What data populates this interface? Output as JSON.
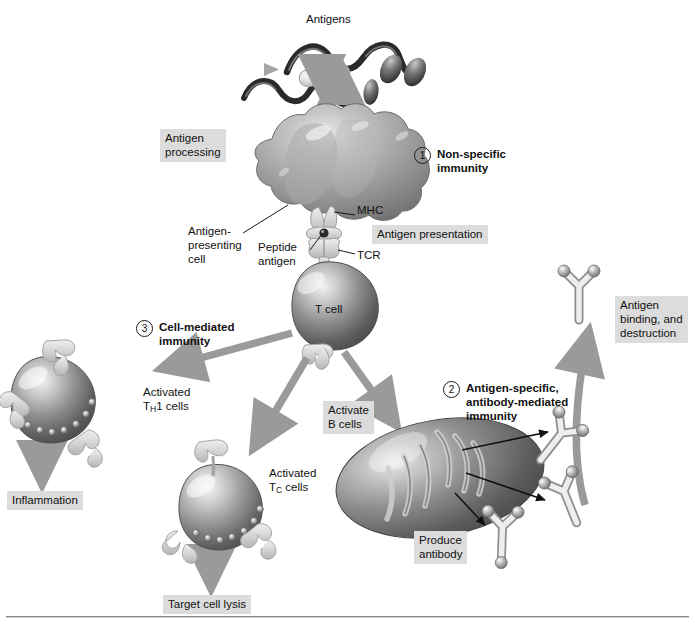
{
  "figure": {
    "background_color": "#ffffff",
    "label_box_color": "#dcdcdc",
    "arrow_color": "#9a9a9a",
    "leader_color": "#1a1a1a"
  },
  "labels": {
    "antigens": "Antigens",
    "antigen_processing": "Antigen\nprocessing",
    "antigen_presenting_cell": "Antigen-\npresenting\ncell",
    "peptide_antigen": "Peptide\nantigen",
    "mhc": "MHC",
    "tcr": "TCR",
    "antigen_presentation": "Antigen presentation",
    "t_cell": "T cell",
    "activated_th1_cells_line1": "Activated",
    "activated_th1_cells_line2_pre": "T",
    "activated_th1_cells_line2_sub": "H",
    "activated_th1_cells_line2_post": "1 cells",
    "activated_tc_cells_line1": "Activated",
    "activated_tc_cells_line2_pre": "T",
    "activated_tc_cells_line2_sub": "C",
    "activated_tc_cells_line2_post": " cells",
    "inflammation": "Inflammation",
    "target_cell_lysis": "Target cell lysis",
    "activate_b_cells": "Activate\nB cells",
    "produce_antibody": "Produce\nantibody",
    "antigen_binding_destruction": "Antigen\nbinding, and\ndestruction"
  },
  "steps": [
    {
      "number": "1",
      "text": "Non-specific\nimmunity"
    },
    {
      "number": "2",
      "text": "Antigen-specific,\nantibody-mediated\nimmunity"
    },
    {
      "number": "3",
      "text": "Cell-mediated\nimmunity"
    }
  ]
}
